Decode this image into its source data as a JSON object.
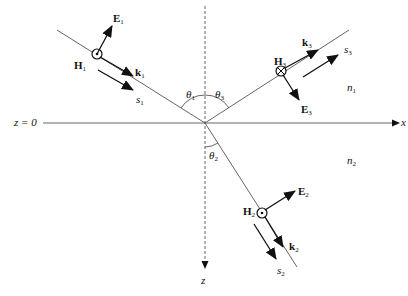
{
  "diagram": {
    "type": "wave-refraction-reflection",
    "axes": {
      "horizontal_label": "x",
      "vertical_label": "z",
      "interface_label": "z = 0"
    },
    "media": {
      "upper": {
        "label": "n",
        "sub": "1"
      },
      "lower": {
        "label": "n",
        "sub": "2"
      }
    },
    "angles": {
      "incident": {
        "label": "θ",
        "sub": "1"
      },
      "transmitted": {
        "label": "θ",
        "sub": "2"
      },
      "reflected": {
        "label": "θ",
        "sub": "3"
      }
    },
    "waves": {
      "incident": {
        "E": {
          "label": "E",
          "sub": "1"
        },
        "H": {
          "label": "H",
          "sub": "1",
          "symbol": "circled-dot"
        },
        "k": {
          "label": "k",
          "sub": "1"
        },
        "s": {
          "label": "s",
          "sub": "1"
        }
      },
      "transmitted": {
        "E": {
          "label": "E",
          "sub": "2"
        },
        "H": {
          "label": "H",
          "sub": "2",
          "symbol": "circled-dot"
        },
        "k": {
          "label": "k",
          "sub": "2"
        },
        "s": {
          "label": "s",
          "sub": "2"
        }
      },
      "reflected": {
        "E": {
          "label": "E",
          "sub": "3"
        },
        "H": {
          "label": "H",
          "sub": "3",
          "symbol": "circled-cross"
        },
        "k": {
          "label": "k",
          "sub": "3"
        },
        "s": {
          "label": "s",
          "sub": "3"
        }
      }
    },
    "colors": {
      "line": "#555555",
      "arrow": "#111111",
      "background": "#ffffff"
    }
  }
}
